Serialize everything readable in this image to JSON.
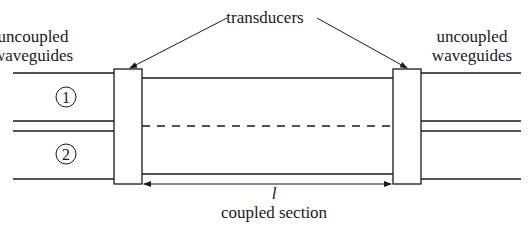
{
  "diagram": {
    "type": "waveguide coupler schematic",
    "labels": {
      "left_uncoupled_line1": "uncoupled",
      "left_uncoupled_line2": "waveguides",
      "right_uncoupled_line1": "uncoupled",
      "right_uncoupled_line2": "waveguides",
      "transducers": "transducers",
      "waveguide_1": "1",
      "waveguide_2": "2",
      "length_symbol": "l",
      "coupled_section": "coupled section"
    },
    "colors": {
      "line": "#1a1a1a",
      "background": "#ffffff"
    }
  }
}
